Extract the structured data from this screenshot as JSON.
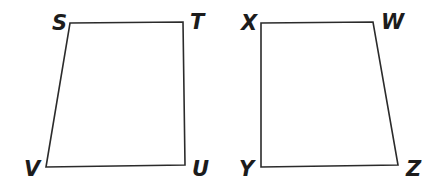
{
  "figure": {
    "title": "",
    "background_color": "#ffffff",
    "stroke_color": "#2b2b2b",
    "label_color": "#1c1c1c",
    "shapes": [
      {
        "name": "quadrilateral-stuv",
        "label_sequence": "STUV",
        "vertices": [
          {
            "label": "S",
            "x": 70,
            "y": 23,
            "label_x": 52,
            "label_y": 30
          },
          {
            "label": "T",
            "x": 183,
            "y": 22,
            "label_x": 190,
            "label_y": 29
          },
          {
            "label": "U",
            "x": 185,
            "y": 165,
            "label_x": 192,
            "label_y": 176
          },
          {
            "label": "V",
            "x": 46,
            "y": 167,
            "label_x": 24,
            "label_y": 176
          }
        ]
      },
      {
        "name": "quadrilateral-xwzy",
        "label_sequence": "XWZY",
        "vertices": [
          {
            "label": "X",
            "x": 261,
            "y": 23,
            "label_x": 241,
            "label_y": 30
          },
          {
            "label": "W",
            "x": 373,
            "y": 22,
            "label_x": 381,
            "label_y": 29
          },
          {
            "label": "Z",
            "x": 398,
            "y": 165,
            "label_x": 406,
            "label_y": 176
          },
          {
            "label": "Y",
            "x": 261,
            "y": 167,
            "label_x": 239,
            "label_y": 176
          }
        ]
      }
    ]
  }
}
